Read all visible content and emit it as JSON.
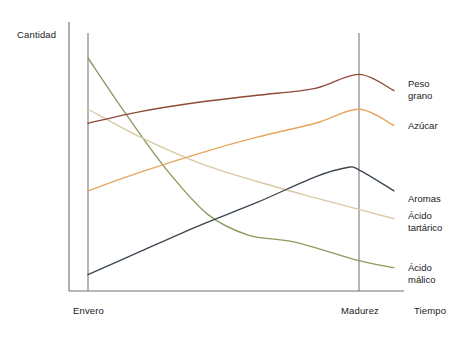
{
  "chart_data": {
    "type": "line",
    "title": "",
    "subtitle": "",
    "xlabel": "Tiempo",
    "ylabel": "Cantidad",
    "grid": false,
    "legend_position": "right-inline",
    "axis_ranges": {
      "x": [
        0,
        1
      ],
      "y": [
        0,
        1
      ]
    },
    "x_tick_labels": [
      "Envero",
      "Madurez"
    ],
    "x_tick_positions": [
      0.07,
      1.0
    ],
    "annotations": [
      {
        "text": "Envero",
        "type": "vertical-marker-line"
      },
      {
        "text": "Madurez",
        "type": "vertical-marker-line"
      }
    ],
    "series": [
      {
        "name": "Peso grano",
        "color": "#8f4a3a",
        "label_lines": "Peso\ngrano",
        "x": [
          0.07,
          0.25,
          0.45,
          0.65,
          0.85,
          1.0,
          1.12
        ],
        "values": [
          0.72,
          0.77,
          0.81,
          0.84,
          0.87,
          0.93,
          0.86
        ]
      },
      {
        "name": "Azúcar",
        "color": "#e8a55f",
        "label_lines": "Azúcar",
        "x": [
          0.07,
          0.25,
          0.45,
          0.65,
          0.85,
          1.0,
          1.12
        ],
        "values": [
          0.43,
          0.51,
          0.59,
          0.66,
          0.72,
          0.78,
          0.71
        ]
      },
      {
        "name": "Aromas",
        "color": "#3c4651",
        "label_lines": "Aromas",
        "x": [
          0.07,
          0.25,
          0.45,
          0.65,
          0.85,
          0.96,
          1.0,
          1.12
        ],
        "values": [
          0.07,
          0.17,
          0.28,
          0.38,
          0.49,
          0.53,
          0.52,
          0.43
        ]
      },
      {
        "name": "Ácido tartárico",
        "color": "#dac9a4",
        "label_lines": "Ácido\ntartárico",
        "x": [
          0.07,
          0.25,
          0.45,
          0.65,
          0.85,
          1.0,
          1.12
        ],
        "values": [
          0.78,
          0.66,
          0.55,
          0.47,
          0.4,
          0.35,
          0.31
        ]
      },
      {
        "name": "Ácido málico",
        "color": "#8b9c5d",
        "label_lines": "Ácido\nmálico",
        "x": [
          0.07,
          0.2,
          0.34,
          0.48,
          0.62,
          0.78,
          1.0,
          1.12
        ],
        "values": [
          1.0,
          0.76,
          0.52,
          0.33,
          0.24,
          0.21,
          0.13,
          0.1
        ]
      }
    ]
  },
  "axes": {
    "y_label": "Cantidad",
    "x_label": "Tiempo"
  },
  "markers": {
    "envero": "Envero",
    "madurez": "Madurez"
  },
  "series_labels": {
    "peso_grano": "Peso\ngrano",
    "azucar": "Azúcar",
    "aromas": "Aromas",
    "acido_tartarico": "Ácido\ntartárico",
    "acido_malico": "Ácido\nmálico"
  },
  "colors": {
    "peso_grano": "#8f4a3a",
    "azucar": "#e8a55f",
    "aromas": "#3c4651",
    "acido_tartarico": "#dac9a4",
    "acido_malico": "#8b9c5d",
    "axis": "#6e6e6e",
    "marker": "#7a7a7a",
    "background": "#ffffff",
    "text": "#1a1a1a"
  }
}
